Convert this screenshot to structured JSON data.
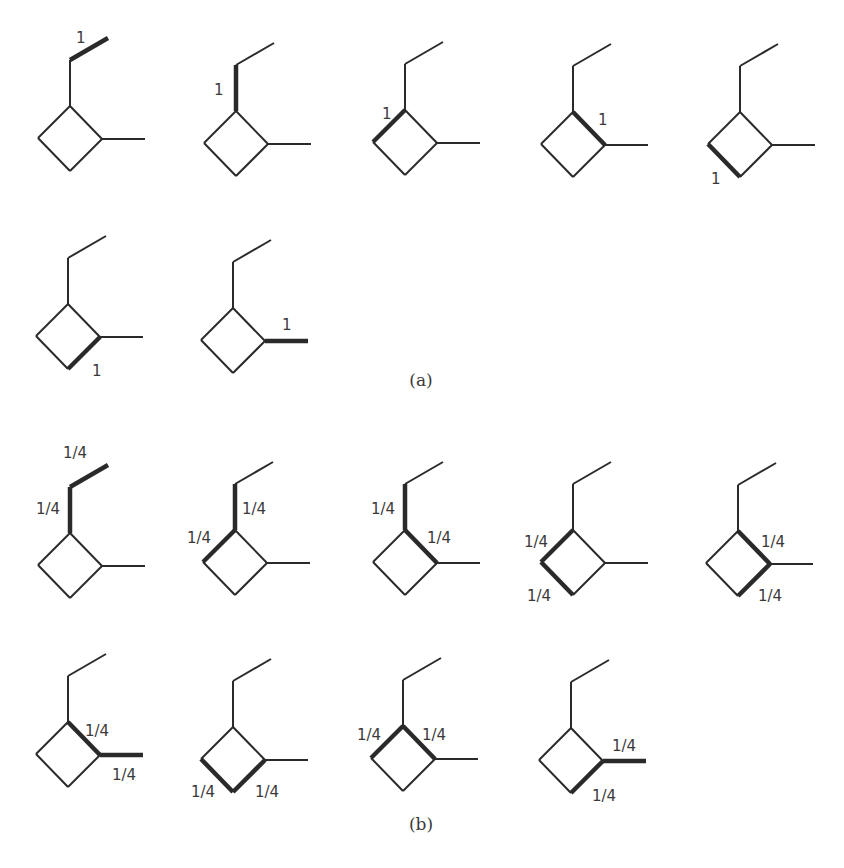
{
  "figure": {
    "panels": [
      {
        "id": "a",
        "caption": "(a)",
        "caption_pos": [
          421,
          386
        ],
        "molecules": [
          {
            "top": [
              70,
              106
            ],
            "bold": [
              "e2"
            ],
            "labels": [
              {
                "text": "1",
                "x": 76,
                "y": 43
              }
            ]
          },
          {
            "top": [
              236,
              111
            ],
            "bold": [
              "e1"
            ],
            "labels": [
              {
                "text": "1",
                "x": 214,
                "y": 95
              }
            ]
          },
          {
            "top": [
              405,
              110
            ],
            "bold": [
              "rtl"
            ],
            "labels": [
              {
                "text": "1",
                "x": 382,
                "y": 119
              }
            ]
          },
          {
            "top": [
              573,
              112
            ],
            "bold": [
              "rtr"
            ],
            "labels": [
              {
                "text": "1",
                "x": 598,
                "y": 125
              }
            ]
          },
          {
            "top": [
              740,
              112
            ],
            "bold": [
              "rbl"
            ],
            "labels": [
              {
                "text": "1",
                "x": 711,
                "y": 184
              }
            ]
          },
          {
            "top": [
              68,
              304
            ],
            "bold": [
              "rbr"
            ],
            "labels": [
              {
                "text": "1",
                "x": 92,
                "y": 376
              }
            ]
          },
          {
            "top": [
              233,
              308
            ],
            "bold": [
              "me"
            ],
            "labels": [
              {
                "text": "1",
                "x": 282,
                "y": 330
              }
            ]
          }
        ]
      },
      {
        "id": "b",
        "caption": "(b)",
        "caption_pos": [
          421,
          830
        ],
        "molecules": [
          {
            "top": [
              70,
              533
            ],
            "bold": [
              "e2",
              "e1"
            ],
            "labels": [
              {
                "text": "1/4",
                "x": 63,
                "y": 458
              },
              {
                "text": "1/4",
                "x": 36,
                "y": 514
              }
            ]
          },
          {
            "top": [
              235,
              530
            ],
            "bold": [
              "e1",
              "rtl"
            ],
            "labels": [
              {
                "text": "1/4",
                "x": 242,
                "y": 514
              },
              {
                "text": "1/4",
                "x": 187,
                "y": 543
              }
            ]
          },
          {
            "top": [
              405,
              530
            ],
            "bold": [
              "e1",
              "rtr"
            ],
            "labels": [
              {
                "text": "1/4",
                "x": 371,
                "y": 514
              },
              {
                "text": "1/4",
                "x": 427,
                "y": 543
              }
            ]
          },
          {
            "top": [
              573,
              530
            ],
            "bold": [
              "rtl",
              "rbl"
            ],
            "labels": [
              {
                "text": "1/4",
                "x": 524,
                "y": 547
              },
              {
                "text": "1/4",
                "x": 527,
                "y": 601
              }
            ]
          },
          {
            "top": [
              738,
              531
            ],
            "bold": [
              "rtr",
              "rbr"
            ],
            "labels": [
              {
                "text": "1/4",
                "x": 761,
                "y": 547
              },
              {
                "text": "1/4",
                "x": 758,
                "y": 601
              }
            ]
          },
          {
            "top": [
              68,
              722
            ],
            "bold": [
              "rtr",
              "me"
            ],
            "labels": [
              {
                "text": "1/4",
                "x": 85,
                "y": 736
              },
              {
                "text": "1/4",
                "x": 112,
                "y": 780
              }
            ]
          },
          {
            "top": [
              233,
              727
            ],
            "bold": [
              "rbl",
              "rbr"
            ],
            "labels": [
              {
                "text": "1/4",
                "x": 191,
                "y": 797
              },
              {
                "text": "1/4",
                "x": 255,
                "y": 797
              }
            ]
          },
          {
            "top": [
              403,
              726
            ],
            "bold": [
              "rtl",
              "rtr"
            ],
            "labels": [
              {
                "text": "1/4",
                "x": 357,
                "y": 740
              },
              {
                "text": "1/4",
                "x": 422,
                "y": 740
              }
            ]
          },
          {
            "top": [
              571,
              728
            ],
            "bold": [
              "me",
              "rbr"
            ],
            "labels": [
              {
                "text": "1/4",
                "x": 612,
                "y": 751
              },
              {
                "text": "1/4",
                "x": 592,
                "y": 801
              }
            ]
          }
        ]
      }
    ]
  }
}
